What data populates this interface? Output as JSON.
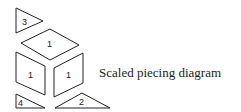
{
  "caption": "Scaled piecing diagram",
  "pieces": [
    {
      "id": "triangle-3",
      "label": "3",
      "points": "16,8 16,33 43,21",
      "label_x": 22,
      "label_y": 25
    },
    {
      "id": "rhombus-top",
      "label": "1",
      "points": "50,29 79,45 50,60 21,43",
      "label_x": 47,
      "label_y": 47
    },
    {
      "id": "rhombus-left",
      "label": "1",
      "points": "16,52 45,66 45,95 16,82",
      "label_x": 28,
      "label_y": 78
    },
    {
      "id": "rhombus-right",
      "label": "1",
      "points": "54,68 83,53 83,83 54,97",
      "label_x": 66,
      "label_y": 78
    },
    {
      "id": "triangle-4",
      "label": "4",
      "points": "16,94 16,108 45,108",
      "label_x": 18,
      "label_y": 106
    },
    {
      "id": "triangle-2",
      "label": "2",
      "points": "55,108 82,93 110,108",
      "label_x": 79,
      "label_y": 105
    }
  ],
  "colors": {
    "stroke": "#222222",
    "background": "#ffffff"
  }
}
